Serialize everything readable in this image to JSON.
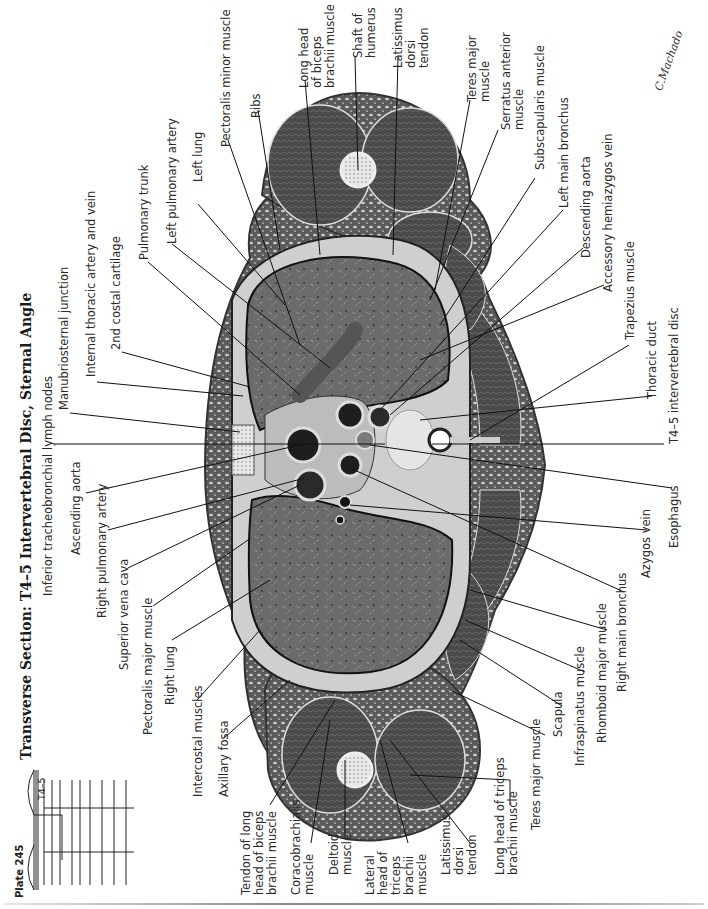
{
  "plate": {
    "number_label": "Plate 245",
    "title": "Transverse Section: T4–5 Intervertebral Disc, Sternal Angle",
    "level_marker": "T4–5",
    "signature": "C.Machado",
    "orientation": "rotated 90° counterclockwise (anterior at left, posterior at right)",
    "palette": {
      "background": "#ffffff",
      "tissue_dark": "#3d3d3d",
      "tissue_mid": "#6e6e6e",
      "fat_light": "#d9d9d9",
      "leader_line": "#111111",
      "text": "#2a2a2a"
    }
  },
  "labels_anterior_side": [
    "Inferior tracheobronchial lymph nodes",
    "Manubriosternal junction",
    "Internal thoracic artery and vein",
    "2nd costal cartilage",
    "Pulmonary trunk",
    "Left pulmonary artery",
    "Left lung",
    "Pectoralis minor muscle",
    "Ribs",
    "Ascending aorta",
    "Right pulmonary artery",
    "Superior vena cava",
    "Pectoralis major muscle",
    "Right lung",
    "Intercostal muscles",
    "Axillary fossa"
  ],
  "labels_left_arm": [
    "Long head\nof biceps\nbrachii muscle",
    "Shaft of\nhumerus",
    "Latissimus\ndorsi\ntendon",
    "Teres major\nmuscle",
    "Serratus anterior\nmuscle",
    "Subscapularis muscle"
  ],
  "labels_posterior_side": [
    "Left main bronchus",
    "Descending aorta",
    "Accessory hemiazygos vein",
    "Trapezius muscle",
    "Thoracic duct",
    "T4–5 intervertebral disc",
    "Esophagus",
    "Azygos vein",
    "Right main bronchus",
    "Rhomboid major muscle",
    "Infraspinatus muscle",
    "Scapula"
  ],
  "labels_right_arm": [
    "Tendon of long\nhead of biceps\nbrachii muscle",
    "Coracobrachialis\nmuscle",
    "Deltoid\nmuscle",
    "Lateral\nhead of\ntriceps\nbrachii\nmuscle",
    "Latissimus\ndorsi\ntendon",
    "Long head of triceps\nbrachii muscle",
    "Teres major muscle"
  ]
}
